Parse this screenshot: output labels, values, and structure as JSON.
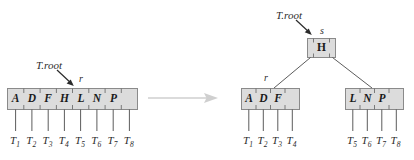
{
  "figure": {
    "type": "b-tree-split-diagram",
    "background_color": "#ffffff",
    "node_fill_color": "#dcdcdc",
    "node_border_color": "#8a8a8a",
    "line_color": "#5a5a5a",
    "transition_arrow_color": "#cccccc",
    "text_color": "#1a1a1a"
  },
  "before": {
    "root_pointer_label": "T.root",
    "node_pointer_label": "r",
    "node": {
      "name": "full-root-node",
      "keys": [
        "A",
        "D",
        "F",
        "H",
        "L",
        "N",
        "P"
      ],
      "children": [
        "T1",
        "T2",
        "T3",
        "T4",
        "T5",
        "T6",
        "T7",
        "T8"
      ]
    },
    "subtree_labels": [
      {
        "base": "T",
        "sub": "1"
      },
      {
        "base": "T",
        "sub": "2"
      },
      {
        "base": "T",
        "sub": "3"
      },
      {
        "base": "T",
        "sub": "4"
      },
      {
        "base": "T",
        "sub": "5"
      },
      {
        "base": "T",
        "sub": "6"
      },
      {
        "base": "T",
        "sub": "7"
      },
      {
        "base": "T",
        "sub": "8"
      }
    ]
  },
  "transition": {
    "symbol": "arrow-right",
    "meaning": "split"
  },
  "after": {
    "root_pointer_label": "T.root",
    "new_root_pointer_label": "s",
    "left_child_pointer_label": "r",
    "root_node": {
      "name": "new-root-node",
      "keys": [
        "H"
      ]
    },
    "left_node": {
      "name": "left-split-node",
      "keys": [
        "A",
        "D",
        "F"
      ],
      "children": [
        "T1",
        "T2",
        "T3",
        "T4"
      ]
    },
    "right_node": {
      "name": "right-split-node",
      "keys": [
        "L",
        "N",
        "P"
      ],
      "children": [
        "T5",
        "T6",
        "T7",
        "T8"
      ]
    },
    "left_subtree_labels": [
      {
        "base": "T",
        "sub": "1"
      },
      {
        "base": "T",
        "sub": "2"
      },
      {
        "base": "T",
        "sub": "3"
      },
      {
        "base": "T",
        "sub": "4"
      }
    ],
    "right_subtree_labels": [
      {
        "base": "T",
        "sub": "5"
      },
      {
        "base": "T",
        "sub": "6"
      },
      {
        "base": "T",
        "sub": "7"
      },
      {
        "base": "T",
        "sub": "8"
      }
    ]
  }
}
